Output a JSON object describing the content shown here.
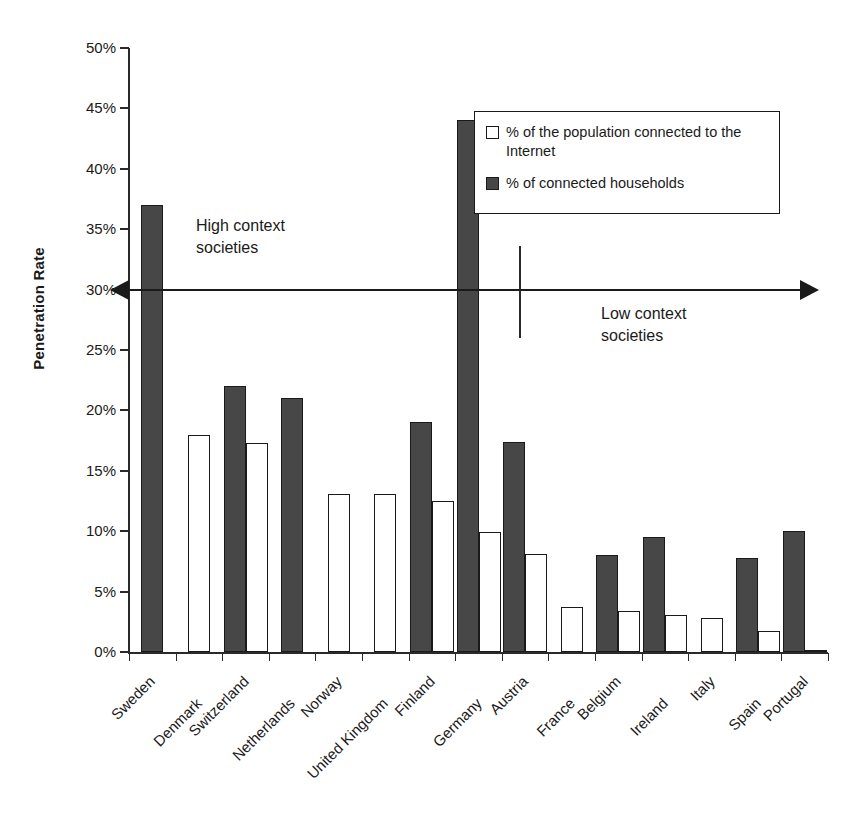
{
  "chart_data": {
    "type": "bar",
    "title": "",
    "xlabel": "",
    "ylabel": "Penetration Rate",
    "ylim": [
      0,
      50
    ],
    "ytick_labels": [
      "50%",
      "45%",
      "40%",
      "35%",
      "30%",
      "25%",
      "20%",
      "15%",
      "10%",
      "5%",
      "0%"
    ],
    "ytick_values": [
      50,
      45,
      40,
      35,
      30,
      25,
      20,
      15,
      10,
      5,
      0
    ],
    "grid": false,
    "legend_position": "upper right",
    "categories": [
      "Sweden",
      "Denmark",
      "Switzerland",
      "Netherlands",
      "Norway",
      "United Kingdom",
      "Finland",
      "Germany",
      "Austria",
      "France",
      "Belgium",
      "Ireland",
      "Italy",
      "Spain",
      "Portugal"
    ],
    "series": [
      {
        "name": "% of connected households",
        "color": "#474747",
        "values": [
          37.0,
          null,
          22.0,
          21.0,
          null,
          null,
          19.0,
          44.0,
          17.4,
          null,
          8.0,
          9.5,
          null,
          7.8,
          10.0
        ]
      },
      {
        "name": "% of the population connected to the Internet",
        "color": "#ffffff",
        "values": [
          null,
          18.0,
          17.3,
          null,
          13.1,
          13.1,
          12.5,
          9.9,
          8.1,
          3.7,
          3.4,
          3.1,
          2.8,
          1.7,
          0.2
        ]
      }
    ],
    "annotations": [
      {
        "id": "high-context",
        "text_line1": "High context",
        "text_line2": "societies"
      },
      {
        "id": "low-context",
        "text_line1": "Low context",
        "text_line2": "societies"
      }
    ]
  },
  "legend": {
    "items": [
      {
        "swatch": "light",
        "label": "% of the population connected to the Internet"
      },
      {
        "swatch": "dark",
        "label": "% of connected households"
      }
    ]
  },
  "annotations": {
    "high_context_line1": "High context",
    "high_context_line2": "societies",
    "low_context_line1": "Low context",
    "low_context_line2": "societies"
  },
  "axis": {
    "y_title": "Penetration Rate"
  }
}
